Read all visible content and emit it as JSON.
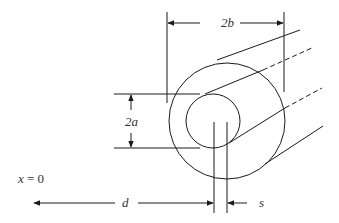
{
  "diagram": {
    "labels": {
      "outer_diameter": "2b",
      "inner_diameter": "2a",
      "distance": "d",
      "offset": "s",
      "plane_pre": "x",
      "plane_post": " = 0"
    },
    "colors": {
      "line": "#1a1a1a",
      "text": "#333333",
      "background": "#ffffff"
    }
  }
}
